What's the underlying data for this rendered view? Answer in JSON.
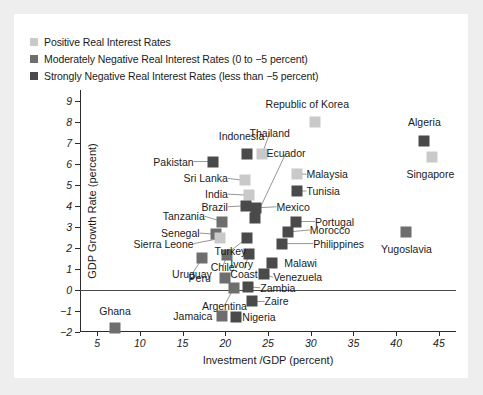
{
  "legend": {
    "items": [
      {
        "label": "Positive Real Interest Rates",
        "color": "#c9c9c9",
        "key": "positive"
      },
      {
        "label": "Moderately Negative Real Interest Rates (0 to −5 percent)",
        "color": "#6e6e6e",
        "key": "moderate"
      },
      {
        "label": "Strongly Negative Real Interest Rates (less than −5 percent)",
        "color": "#4a4a4a",
        "key": "strong"
      }
    ]
  },
  "colors": {
    "positive": "#c9c9c9",
    "moderate": "#6e6e6e",
    "strong": "#4a4a4a",
    "axis": "#2b2b2b",
    "text": "#1b1b1b",
    "card": "#ffffff",
    "page": "#eeeeee"
  },
  "chart_data": {
    "type": "scatter",
    "title": "",
    "xlabel": "Investment /GDP (percent)",
    "ylabel": "GDP Growth Rate (percent)",
    "xlim": [
      3,
      47
    ],
    "ylim": [
      -2,
      9.5
    ],
    "xticks": [
      5,
      10,
      15,
      20,
      25,
      30,
      35,
      40,
      45
    ],
    "yticks": [
      -2,
      -1,
      0,
      1,
      2,
      3,
      4,
      5,
      6,
      7,
      8,
      9
    ],
    "grid": false,
    "zero_line": true,
    "legend_position": "above-plot",
    "series": [
      {
        "name": "Positive Real Interest Rates",
        "color": "#c9c9c9"
      },
      {
        "name": "Moderately Negative Real Interest Rates (0 to −5 percent)",
        "color": "#6e6e6e"
      },
      {
        "name": "Strongly Negative Real Interest Rates (less than −5 percent)",
        "color": "#4a4a4a"
      }
    ],
    "points": [
      {
        "name": "Republic of Korea",
        "x": 30.5,
        "y": 8.0,
        "group": "positive",
        "label_x": 29.6,
        "label_y": 8.85,
        "anchor": "c",
        "leader": false
      },
      {
        "name": "Algeria",
        "x": 43.3,
        "y": 7.1,
        "group": "strong",
        "label_x": 43.3,
        "label_y": 8.0,
        "anchor": "c",
        "leader": false
      },
      {
        "name": "Singapore",
        "x": 44.2,
        "y": 6.3,
        "group": "positive",
        "label_x": 44.0,
        "label_y": 5.5,
        "anchor": "c",
        "leader": false
      },
      {
        "name": "Indonesia",
        "x": 22.6,
        "y": 6.45,
        "group": "strong",
        "label_x": 21.9,
        "label_y": 7.3,
        "anchor": "c",
        "leader": false
      },
      {
        "name": "Thailand",
        "x": 24.3,
        "y": 6.45,
        "group": "positive",
        "label_x": 25.2,
        "label_y": 7.45,
        "anchor": "c",
        "leader": true
      },
      {
        "name": "Ecuador",
        "x": 23.5,
        "y": 3.4,
        "group": "strong",
        "label_x": 27.1,
        "label_y": 6.5,
        "anchor": "c",
        "leader": true
      },
      {
        "name": "Pakistan",
        "x": 18.6,
        "y": 6.1,
        "group": "strong",
        "label_x": 16.3,
        "label_y": 6.1,
        "anchor": "r",
        "leader": true
      },
      {
        "name": "Malaysia",
        "x": 28.4,
        "y": 5.5,
        "group": "positive",
        "label_x": 29.5,
        "label_y": 5.5,
        "anchor": "l",
        "leader": true
      },
      {
        "name": "Tunisia",
        "x": 28.4,
        "y": 4.7,
        "group": "strong",
        "label_x": 29.5,
        "label_y": 4.7,
        "anchor": "l",
        "leader": true
      },
      {
        "name": "Sri Lanka",
        "x": 22.3,
        "y": 5.2,
        "group": "positive",
        "label_x": 20.3,
        "label_y": 5.3,
        "anchor": "r",
        "leader": true
      },
      {
        "name": "India",
        "x": 22.8,
        "y": 4.5,
        "group": "positive",
        "label_x": 20.3,
        "label_y": 4.55,
        "anchor": "r",
        "leader": true
      },
      {
        "name": "Brazil",
        "x": 22.4,
        "y": 4.0,
        "group": "strong",
        "label_x": 20.3,
        "label_y": 3.95,
        "anchor": "r",
        "leader": true
      },
      {
        "name": "Mexico",
        "x": 23.6,
        "y": 3.9,
        "group": "strong",
        "label_x": 26.0,
        "label_y": 3.95,
        "anchor": "l",
        "leader": true
      },
      {
        "name": "Portugal",
        "x": 28.3,
        "y": 3.25,
        "group": "strong",
        "label_x": 30.5,
        "label_y": 3.25,
        "anchor": "l",
        "leader": true
      },
      {
        "name": "Tanzania",
        "x": 19.6,
        "y": 3.25,
        "group": "moderate",
        "label_x": 17.6,
        "label_y": 3.5,
        "anchor": "r",
        "leader": true
      },
      {
        "name": "Morocco",
        "x": 27.3,
        "y": 2.75,
        "group": "strong",
        "label_x": 29.9,
        "label_y": 2.85,
        "anchor": "l",
        "leader": true
      },
      {
        "name": "Yugoslavia",
        "x": 41.1,
        "y": 2.75,
        "group": "moderate",
        "label_x": 41.2,
        "label_y": 1.95,
        "anchor": "c",
        "leader": false
      },
      {
        "name": "Senegal",
        "x": 18.9,
        "y": 2.65,
        "group": "moderate",
        "label_x": 17.0,
        "label_y": 2.7,
        "anchor": "r",
        "leader": true
      },
      {
        "name": "Turkey",
        "x": 22.5,
        "y": 2.45,
        "group": "strong",
        "label_x": 20.6,
        "label_y": 1.85,
        "anchor": "c",
        "leader": true
      },
      {
        "name": "Philippines",
        "x": 26.6,
        "y": 2.2,
        "group": "strong",
        "label_x": 30.3,
        "label_y": 2.2,
        "anchor": "l",
        "leader": true
      },
      {
        "name": "Sierra Leone",
        "x": 19.4,
        "y": 2.45,
        "group": "positive",
        "label_x": 16.3,
        "label_y": 2.2,
        "anchor": "r",
        "leader": true
      },
      {
        "name": "Chile",
        "x": 20.2,
        "y": 1.65,
        "group": "moderate",
        "label_x": 19.7,
        "label_y": 1.1,
        "anchor": "c",
        "leader": true
      },
      {
        "name": "Ivory Coast",
        "x": 22.8,
        "y": 1.7,
        "group": "strong",
        "label_x": 22.2,
        "label_y": 1.0,
        "anchor": "c",
        "leader": true,
        "two_line": true
      },
      {
        "name": "Malawi",
        "x": 25.5,
        "y": 1.3,
        "group": "strong",
        "label_x": 26.9,
        "label_y": 1.3,
        "anchor": "l",
        "leader": false
      },
      {
        "name": "Uruguay",
        "x": 17.3,
        "y": 1.5,
        "group": "moderate",
        "label_x": 16.1,
        "label_y": 0.75,
        "anchor": "c",
        "leader": true
      },
      {
        "name": "Venezuela",
        "x": 24.5,
        "y": 0.75,
        "group": "strong",
        "label_x": 25.6,
        "label_y": 0.6,
        "anchor": "l",
        "leader": true
      },
      {
        "name": "Peru",
        "x": 20.0,
        "y": 0.55,
        "group": "moderate",
        "label_x": 18.3,
        "label_y": 0.55,
        "anchor": "r",
        "leader": false
      },
      {
        "name": "Zambia",
        "x": 22.7,
        "y": 0.15,
        "group": "strong",
        "label_x": 24.1,
        "label_y": 0.1,
        "anchor": "l",
        "leader": true
      },
      {
        "name": "Argentina",
        "x": 21.0,
        "y": 0.1,
        "group": "moderate",
        "label_x": 19.9,
        "label_y": -0.75,
        "anchor": "c",
        "leader": true
      },
      {
        "name": "Zaire",
        "x": 23.1,
        "y": -0.55,
        "group": "strong",
        "label_x": 24.6,
        "label_y": -0.55,
        "anchor": "l",
        "leader": true
      },
      {
        "name": "Jamaica",
        "x": 19.6,
        "y": -1.25,
        "group": "moderate",
        "label_x": 18.5,
        "label_y": -1.25,
        "anchor": "r",
        "leader": false
      },
      {
        "name": "Nigeria",
        "x": 21.2,
        "y": -1.3,
        "group": "strong",
        "label_x": 22.0,
        "label_y": -1.3,
        "anchor": "l",
        "leader": false
      },
      {
        "name": "Ghana",
        "x": 7.1,
        "y": -1.8,
        "group": "moderate",
        "label_x": 7.1,
        "label_y": -1.0,
        "anchor": "c",
        "leader": false
      }
    ]
  }
}
